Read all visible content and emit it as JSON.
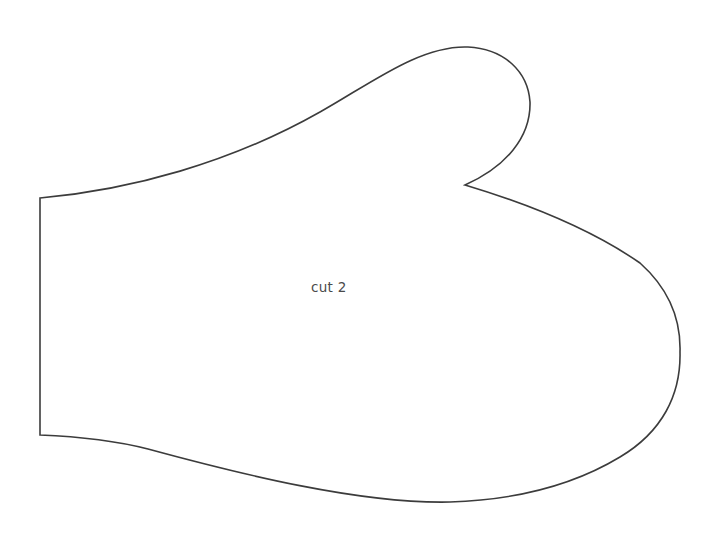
{
  "pattern": {
    "label": "cut 2",
    "outline_color": "#3c3c3c",
    "background_color": "#ffffff",
    "label_color": "#4a4a4a",
    "piece_name": "mitten-outline"
  }
}
